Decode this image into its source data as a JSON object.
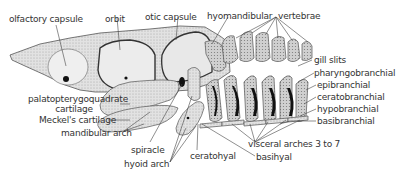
{
  "diagram": {
    "colors": {
      "background": "#ffffff",
      "label_text": "#333333",
      "leader_line": "#444444",
      "cartilage_fill": "#d4d4d4",
      "cartilage_stroke": "#555555",
      "gill_slit": "#111111"
    },
    "labels": {
      "olfactory_capsule": "olfactory capsule",
      "orbit": "orbit",
      "otic_capsule": "otic capsule",
      "hyomandibular": "hyomandibular",
      "vertebrae": "vertebrae",
      "gill_slits": "gill slits",
      "pharyngobranchial": "pharyngobranchial",
      "epibranchial": "epibranchial",
      "ceratobranchial": "ceratobranchial",
      "hypobranchial": "hypobranchial",
      "basibranchial": "basibranchial",
      "palatopterygoquadrate_line1": "palatopterygoquadrate",
      "palatopterygoquadrate_line2": "cartilage",
      "meckels_cartilage": "Meckel's cartilage",
      "mandibular_arch": "mandibular arch",
      "spiracle": "spiracle",
      "hyoid_arch": "hyoid arch",
      "ceratohyal": "ceratohyal",
      "visceral_arches": "visceral arches 3 to 7",
      "basihyal": "basihyal"
    }
  }
}
